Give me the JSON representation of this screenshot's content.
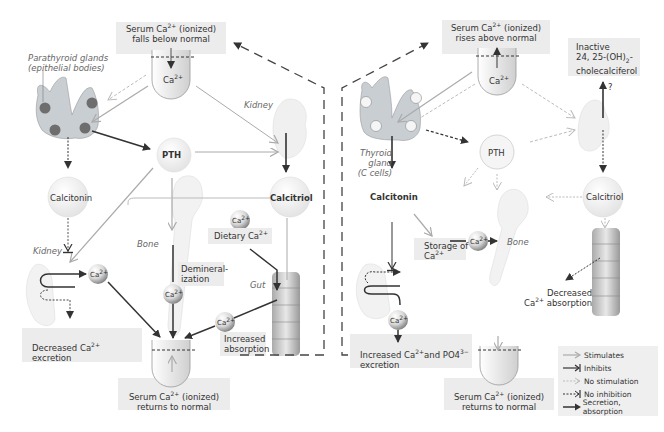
{
  "left_panel": {
    "top_box": {
      "line1_pre": "Serum Ca",
      "sup": "2+",
      "line1_post": " (ionized)",
      "line2": "falls below normal"
    },
    "beaker_label": {
      "text": "Ca",
      "sup": "2+"
    },
    "parathyroid_label": {
      "line1": "Parathyroid glands",
      "line2": "(epithelial bodies)"
    },
    "kidney_top_label": "Kidney",
    "pth": "PTH",
    "calcitriol": "Calcitriol",
    "calcitonin": "Calcitonin",
    "kidney_bottom_label": "Kidney",
    "bone_label": "Bone",
    "gut_label": "Gut",
    "ca_ball": {
      "text": "Ca",
      "sup": "2+"
    },
    "dietary": {
      "text": "Dietary Ca",
      "sup": "2+"
    },
    "demineralization": {
      "line1": "Demineral-",
      "line2": "ization"
    },
    "increased_absorption": {
      "line1": "Increased",
      "line2": "absorption"
    },
    "decreased_excretion": {
      "line1_pre": "Decreased Ca",
      "sup": "2+",
      "line2": "excretion"
    },
    "bottom_box": {
      "line1_pre": "Serum Ca",
      "sup": "2+",
      "line1_post": " (ionized)",
      "line2": "returns to normal"
    }
  },
  "right_panel": {
    "top_box": {
      "line1_pre": "Serum Ca",
      "sup": "2+",
      "line1_post": " (ionized)",
      "line2": "rises above normal"
    },
    "beaker_label": {
      "text": "Ca",
      "sup": "2+"
    },
    "inactive_box": {
      "line1": "Inactive",
      "line2_pre": "24, 25-(OH)",
      "line2_sub": "2",
      "line2_post": "-",
      "line3": "cholecalciferol"
    },
    "question_mark": "?",
    "thyroid_label": {
      "line1": "Thyroid",
      "line2": "gland",
      "line3": "(C cells)"
    },
    "pth": "PTH",
    "calcitonin": "Calcitonin",
    "calcitriol": "Calcitriol",
    "bone_label": "Bone",
    "ca_ball": {
      "text": "Ca",
      "sup": "2+"
    },
    "storage": {
      "line1": "Storage of",
      "line2": "Ca",
      "sup": "2+"
    },
    "decreased_absorption": {
      "line1": "Decreased",
      "line2_pre": "Ca",
      "sup": "2+",
      "line2_post": " absorption"
    },
    "increased_excretion": {
      "line1_pre": "Increased Ca",
      "sup1": "2+",
      "line1_mid": "and PO4",
      "sup2": "3−",
      "line2": "excretion"
    },
    "bottom_box": {
      "line1_pre": "Serum Ca",
      "sup": "2+",
      "line1_post": " (ionized)",
      "line2": "returns to normal"
    }
  },
  "legend": {
    "items": [
      {
        "label": "Stimulates",
        "style": "gray-solid-open-arrow"
      },
      {
        "label": "Inhibits",
        "style": "dark-solid-bar-arrow"
      },
      {
        "label": "No stimulation",
        "style": "gray-dotted-open-arrow"
      },
      {
        "label": "No inhibition",
        "style": "dark-dashed-bar-arrow"
      },
      {
        "label": "Secretion, absorption",
        "style": "dark-solid-filled-arrow"
      }
    ]
  },
  "colors": {
    "dark_arrow": "#333333",
    "gray_arrow": "#aaaaaa",
    "box_bg": "#ececec",
    "gland_fill": "#c9ced3",
    "gland_dot": "#6e6e6e"
  }
}
